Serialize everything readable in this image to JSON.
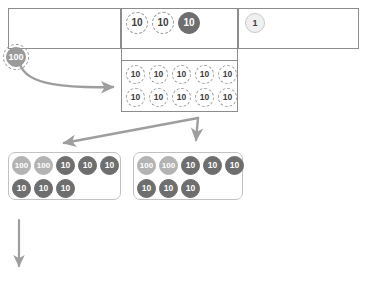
{
  "diagram": {
    "accent_colors": {
      "disc_solid": "#6e6e6e",
      "disc_light": "#b3b3b3",
      "disc_outline": "#9a9a9a",
      "arrow": "#9e9e9e",
      "chart_border": "#8c8c8c",
      "group_border": "#c2c2c2"
    }
  },
  "place_value_chart": {
    "hundreds_cell": {
      "name": "hundreds-cell",
      "discs": []
    },
    "tens_cell": {
      "name": "tens-cell",
      "discs": [
        {
          "label": "10",
          "style": "dashed"
        },
        {
          "label": "10",
          "style": "dashed"
        },
        {
          "label": "10",
          "style": "solid"
        }
      ]
    },
    "ones_cell": {
      "name": "ones-cell",
      "discs": [
        {
          "label": "1",
          "style": "unit"
        }
      ]
    }
  },
  "tens_expansion": {
    "name": "tens-expansion-box",
    "row1": [
      {
        "label": "10",
        "style": "dashed"
      },
      {
        "label": "10",
        "style": "dashed"
      },
      {
        "label": "10",
        "style": "dashed"
      },
      {
        "label": "10",
        "style": "dashed"
      },
      {
        "label": "10",
        "style": "dashed"
      }
    ],
    "row2": [
      {
        "label": "10",
        "style": "dashed"
      },
      {
        "label": "10",
        "style": "dashed"
      },
      {
        "label": "10",
        "style": "dashed"
      },
      {
        "label": "10",
        "style": "dashed"
      },
      {
        "label": "10",
        "style": "dashed"
      }
    ]
  },
  "hundred_source_disc": {
    "label": "100",
    "style": "ring"
  },
  "group_left": {
    "name": "group-left",
    "row1": [
      {
        "label": "100",
        "style": "light"
      },
      {
        "label": "100",
        "style": "light"
      },
      {
        "label": "10",
        "style": "solid"
      },
      {
        "label": "10",
        "style": "solid"
      },
      {
        "label": "10",
        "style": "solid"
      }
    ],
    "row2": [
      {
        "label": "10",
        "style": "solid"
      },
      {
        "label": "10",
        "style": "solid"
      },
      {
        "label": "10",
        "style": "solid"
      }
    ]
  },
  "group_right": {
    "name": "group-right",
    "row1": [
      {
        "label": "100",
        "style": "light"
      },
      {
        "label": "100",
        "style": "light"
      },
      {
        "label": "10",
        "style": "solid"
      },
      {
        "label": "10",
        "style": "solid"
      },
      {
        "label": "10",
        "style": "solid"
      }
    ],
    "row2": [
      {
        "label": "10",
        "style": "solid"
      },
      {
        "label": "10",
        "style": "solid"
      },
      {
        "label": "10",
        "style": "solid"
      }
    ]
  },
  "arrows": [
    {
      "name": "arrow-hundred-to-tens",
      "kind": "curved-right"
    },
    {
      "name": "arrow-split-left",
      "kind": "diagonal-down-left"
    },
    {
      "name": "arrow-split-down",
      "kind": "down"
    },
    {
      "name": "arrow-next-step",
      "kind": "down"
    }
  ]
}
